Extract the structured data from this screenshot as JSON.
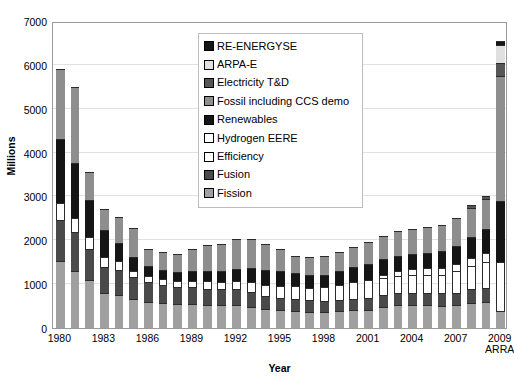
{
  "chart_data": {
    "type": "bar",
    "stacked": true,
    "title": "",
    "xlabel": "Year",
    "ylabel": "Millions",
    "ylim": [
      0,
      7000
    ],
    "ytick_values": [
      0,
      1000,
      2000,
      3000,
      4000,
      5000,
      6000,
      7000
    ],
    "ytick_labels": [
      "0",
      "1000",
      "2000",
      "3000",
      "4000",
      "5000",
      "6000",
      "7000"
    ],
    "grid": true,
    "legend_position": "upper-center-inside",
    "categories": [
      "1980",
      "1981",
      "1982",
      "1983",
      "1984",
      "1985",
      "1986",
      "1987",
      "1988",
      "1989",
      "1990",
      "1991",
      "1992",
      "1993",
      "1994",
      "1995",
      "1996",
      "1997",
      "1998",
      "1999",
      "2000",
      "2001",
      "2002",
      "2003",
      "2004",
      "2005",
      "2006",
      "2007",
      "2008",
      "2009",
      "2009\nARRA"
    ],
    "xtick_labels": [
      {
        "category": "1980",
        "label": "1980"
      },
      {
        "category": "1983",
        "label": "1983"
      },
      {
        "category": "1986",
        "label": "1986"
      },
      {
        "category": "1989",
        "label": "1989"
      },
      {
        "category": "1992",
        "label": "1992"
      },
      {
        "category": "1995",
        "label": "1995"
      },
      {
        "category": "1998",
        "label": "1998"
      },
      {
        "category": "2001",
        "label": "2001"
      },
      {
        "category": "2004",
        "label": "2004"
      },
      {
        "category": "2007",
        "label": "2007"
      },
      {
        "category": "2009\nARRA",
        "label": "2009\nARRA"
      }
    ],
    "series": [
      {
        "name": "Fission",
        "color": "#a0a0a0",
        "values": [
          1520,
          1300,
          1100,
          800,
          760,
          660,
          600,
          560,
          540,
          540,
          520,
          520,
          520,
          480,
          430,
          400,
          380,
          360,
          360,
          380,
          400,
          420,
          480,
          520,
          520,
          520,
          510,
          520,
          580,
          600,
          380
        ]
      },
      {
        "name": "Fusion",
        "color": "#4a4a4a",
        "values": [
          950,
          880,
          700,
          600,
          560,
          500,
          450,
          420,
          400,
          390,
          380,
          360,
          360,
          330,
          300,
          290,
          280,
          270,
          260,
          260,
          260,
          270,
          270,
          270,
          270,
          270,
          280,
          290,
          300,
          310,
          0
        ]
      },
      {
        "name": "Efficiency",
        "color": "#ffffff",
        "values": [
          380,
          330,
          280,
          230,
          200,
          150,
          130,
          130,
          140,
          150,
          170,
          180,
          200,
          230,
          260,
          280,
          290,
          290,
          310,
          340,
          380,
          400,
          400,
          400,
          410,
          420,
          430,
          480,
          540,
          600,
          1130
        ]
      },
      {
        "name": "Hydrogen EERE",
        "color": "#ffffff",
        "values": [
          0,
          0,
          0,
          0,
          0,
          0,
          0,
          0,
          0,
          0,
          0,
          0,
          0,
          0,
          0,
          0,
          0,
          0,
          0,
          0,
          0,
          0,
          60,
          110,
          140,
          150,
          160,
          170,
          180,
          190,
          0
        ]
      },
      {
        "name": "Renewables",
        "color": "#151515",
        "values": [
          1450,
          1250,
          850,
          600,
          420,
          310,
          230,
          210,
          200,
          210,
          220,
          240,
          270,
          320,
          340,
          330,
          300,
          290,
          290,
          320,
          360,
          380,
          360,
          350,
          340,
          350,
          370,
          420,
          480,
          550,
          1380
        ]
      },
      {
        "name": "Fossil including CCS demo",
        "color": "#8e8e8e",
        "values": [
          1600,
          1740,
          620,
          490,
          600,
          660,
          400,
          420,
          410,
          510,
          600,
          620,
          680,
          670,
          580,
          510,
          400,
          420,
          420,
          430,
          450,
          500,
          520,
          560,
          580,
          600,
          610,
          640,
          660,
          690,
          2860
        ]
      },
      {
        "name": "Electricity T&D",
        "color": "#565656",
        "values": [
          0,
          0,
          0,
          0,
          0,
          0,
          0,
          0,
          0,
          0,
          0,
          0,
          0,
          0,
          0,
          0,
          0,
          0,
          0,
          0,
          0,
          0,
          0,
          0,
          0,
          0,
          0,
          0,
          60,
          70,
          300
        ]
      },
      {
        "name": "ARPA-E",
        "color": "#e0e0e0",
        "values": [
          0,
          0,
          0,
          0,
          0,
          0,
          0,
          0,
          0,
          0,
          0,
          0,
          0,
          0,
          0,
          0,
          0,
          0,
          0,
          0,
          0,
          0,
          0,
          0,
          0,
          0,
          0,
          0,
          0,
          0,
          400
        ]
      },
      {
        "name": "RE-ENERGYSE",
        "color": "#151515",
        "values": [
          0,
          0,
          0,
          0,
          0,
          0,
          0,
          0,
          0,
          0,
          0,
          0,
          0,
          0,
          0,
          0,
          0,
          0,
          0,
          0,
          0,
          0,
          0,
          0,
          0,
          0,
          0,
          0,
          0,
          0,
          100
        ]
      }
    ],
    "bar_totals": [
      5900,
      5500,
      3550,
      2720,
      2540,
      2280,
      1810,
      1740,
      1690,
      1800,
      1890,
      1900,
      2030,
      2030,
      1910,
      1810,
      1650,
      1630,
      1640,
      1730,
      1850,
      1970,
      2090,
      2210,
      2260,
      2310,
      2360,
      2520,
      2800,
      3010,
      6550
    ]
  },
  "legend": {
    "items": [
      {
        "label": "RE-ENERGYSE",
        "color": "#151515",
        "border": "#000000"
      },
      {
        "label": "ARPA-E",
        "color": "#e0e0e0",
        "border": "#000000"
      },
      {
        "label": "Electricity T&D",
        "color": "#565656",
        "border": "#000000"
      },
      {
        "label": "Fossil including CCS demo",
        "color": "#8e8e8e",
        "border": "#000000"
      },
      {
        "label": "Renewables",
        "color": "#151515",
        "border": "#000000"
      },
      {
        "label": "Hydrogen EERE",
        "color": "#ffffff",
        "border": "#000000"
      },
      {
        "label": "Efficiency",
        "color": "#ffffff",
        "border": "#000000"
      },
      {
        "label": "Fusion",
        "color": "#4a4a4a",
        "border": "#000000"
      },
      {
        "label": "Fission",
        "color": "#a0a0a0",
        "border": "#000000"
      }
    ]
  },
  "colors": {
    "plot_border": "#9a9a9a",
    "gridline": "#e2e2e2",
    "background": "#ffffff",
    "text": "#000000"
  }
}
